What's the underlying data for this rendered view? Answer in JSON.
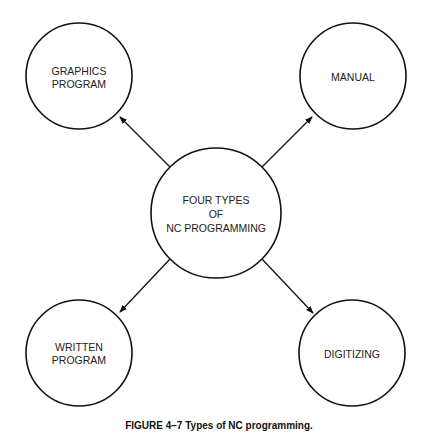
{
  "diagram": {
    "center": {
      "lines": [
        "FOUR TYPES",
        "OF",
        "NC PROGRAMMING"
      ]
    },
    "nodes": [
      {
        "id": "graphics",
        "lines": [
          "GRAPHICS",
          "PROGRAM"
        ]
      },
      {
        "id": "manual",
        "lines": [
          "MANUAL"
        ]
      },
      {
        "id": "written",
        "lines": [
          "WRITTEN",
          "PROGRAM"
        ]
      },
      {
        "id": "digitizing",
        "lines": [
          "DIGITIZING"
        ]
      }
    ],
    "caption": "FIGURE 4–7  Types of NC programming.",
    "stroke_color": "#111111"
  }
}
